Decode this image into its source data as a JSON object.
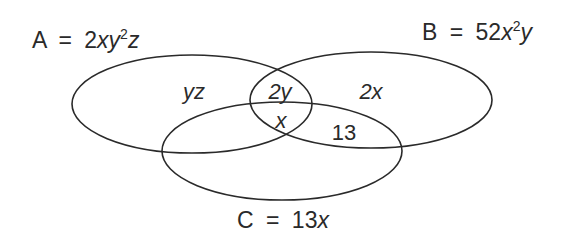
{
  "diagram": {
    "type": "venn",
    "sets": [
      {
        "name": "A",
        "equals": "=",
        "coef": "2",
        "expr_parts": [
          "x",
          "y",
          "2",
          "z"
        ],
        "label_display": "A = 2xy²z"
      },
      {
        "name": "B",
        "equals": "=",
        "coef": "52",
        "expr_parts": [
          "x",
          "2",
          "y"
        ],
        "label_display": "B = 52x²y"
      },
      {
        "name": "C",
        "equals": "=",
        "coef": "13",
        "expr_parts": [
          "x"
        ],
        "label_display": "C = 13x"
      }
    ],
    "regions": {
      "A_only": "yz",
      "A_and_B_only": "2y",
      "B_only": "2x",
      "A_and_B_and_C": "x",
      "B_and_C_only": "13"
    },
    "stroke_color": "#2a2a2a"
  }
}
